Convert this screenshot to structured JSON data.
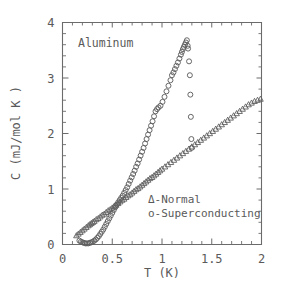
{
  "chart_data": {
    "type": "scatter",
    "title": "",
    "annotation": "Aluminum",
    "xlabel": "T (K)",
    "ylabel": "C (mJ/mol K )",
    "xlim": [
      0,
      2
    ],
    "ylim": [
      0,
      4
    ],
    "xticks": [
      0,
      0.5,
      1,
      1.5,
      2
    ],
    "xticklabels": [
      "0",
      "0.5",
      "1",
      "1.5",
      "2"
    ],
    "yticks": [
      0,
      1,
      2,
      3,
      4
    ],
    "yticklabels": [
      "0",
      "1",
      "2",
      "3",
      "4"
    ],
    "x_minor_step": 0.1,
    "y_minor_step": 0.2,
    "grid": false,
    "legend_position": "inside-lower-right",
    "legend": [
      {
        "marker": "triangle",
        "label": "Δ-Normal"
      },
      {
        "marker": "circle",
        "label": "o-Superconducting"
      }
    ],
    "series": [
      {
        "name": "Normal",
        "marker": "triangle",
        "points": [
          [
            0.14,
            0.16
          ],
          [
            0.16,
            0.19
          ],
          [
            0.18,
            0.22
          ],
          [
            0.2,
            0.25
          ],
          [
            0.22,
            0.28
          ],
          [
            0.24,
            0.31
          ],
          [
            0.26,
            0.34
          ],
          [
            0.275,
            0.36
          ],
          [
            0.29,
            0.38
          ],
          [
            0.305,
            0.4
          ],
          [
            0.32,
            0.42
          ],
          [
            0.34,
            0.45
          ],
          [
            0.36,
            0.47
          ],
          [
            0.38,
            0.5
          ],
          [
            0.4,
            0.53
          ],
          [
            0.42,
            0.55
          ],
          [
            0.44,
            0.58
          ],
          [
            0.46,
            0.61
          ],
          [
            0.48,
            0.63
          ],
          [
            0.5,
            0.66
          ],
          [
            0.52,
            0.69
          ],
          [
            0.54,
            0.71
          ],
          [
            0.56,
            0.74
          ],
          [
            0.58,
            0.77
          ],
          [
            0.6,
            0.8
          ],
          [
            0.62,
            0.82
          ],
          [
            0.64,
            0.85
          ],
          [
            0.66,
            0.88
          ],
          [
            0.68,
            0.9
          ],
          [
            0.7,
            0.93
          ],
          [
            0.72,
            0.96
          ],
          [
            0.74,
            0.99
          ],
          [
            0.76,
            1.01
          ],
          [
            0.78,
            1.04
          ],
          [
            0.8,
            1.07
          ],
          [
            0.82,
            1.1
          ],
          [
            0.84,
            1.13
          ],
          [
            0.86,
            1.16
          ],
          [
            0.88,
            1.19
          ],
          [
            0.9,
            1.21
          ],
          [
            0.92,
            1.24
          ],
          [
            0.94,
            1.27
          ],
          [
            0.96,
            1.3
          ],
          [
            0.98,
            1.33
          ],
          [
            1.0,
            1.36
          ],
          [
            1.03,
            1.4
          ],
          [
            1.06,
            1.44
          ],
          [
            1.09,
            1.48
          ],
          [
            1.12,
            1.52
          ],
          [
            1.15,
            1.56
          ],
          [
            1.18,
            1.6
          ],
          [
            1.21,
            1.64
          ],
          [
            1.24,
            1.68
          ],
          [
            1.27,
            1.72
          ],
          [
            1.3,
            1.76
          ],
          [
            1.33,
            1.8
          ],
          [
            1.36,
            1.84
          ],
          [
            1.39,
            1.88
          ],
          [
            1.42,
            1.92
          ],
          [
            1.45,
            1.96
          ],
          [
            1.48,
            2.0
          ],
          [
            1.51,
            2.04
          ],
          [
            1.54,
            2.08
          ],
          [
            1.57,
            2.12
          ],
          [
            1.6,
            2.16
          ],
          [
            1.63,
            2.2
          ],
          [
            1.66,
            2.24
          ],
          [
            1.69,
            2.28
          ],
          [
            1.72,
            2.32
          ],
          [
            1.75,
            2.36
          ],
          [
            1.78,
            2.4
          ],
          [
            1.81,
            2.44
          ],
          [
            1.84,
            2.48
          ],
          [
            1.87,
            2.52
          ],
          [
            1.9,
            2.55
          ],
          [
            1.93,
            2.58
          ],
          [
            1.96,
            2.6
          ],
          [
            1.99,
            2.62
          ]
        ]
      },
      {
        "name": "Superconducting",
        "marker": "circle",
        "points": [
          [
            0.17,
            0.07
          ],
          [
            0.185,
            0.05
          ],
          [
            0.2,
            0.04
          ],
          [
            0.215,
            0.03
          ],
          [
            0.23,
            0.02
          ],
          [
            0.245,
            0.02
          ],
          [
            0.26,
            0.02
          ],
          [
            0.275,
            0.03
          ],
          [
            0.29,
            0.04
          ],
          [
            0.305,
            0.05
          ],
          [
            0.32,
            0.07
          ],
          [
            0.335,
            0.09
          ],
          [
            0.35,
            0.12
          ],
          [
            0.365,
            0.15
          ],
          [
            0.38,
            0.19
          ],
          [
            0.395,
            0.23
          ],
          [
            0.41,
            0.27
          ],
          [
            0.425,
            0.32
          ],
          [
            0.44,
            0.37
          ],
          [
            0.455,
            0.42
          ],
          [
            0.47,
            0.47
          ],
          [
            0.485,
            0.52
          ],
          [
            0.5,
            0.57
          ],
          [
            0.515,
            0.62
          ],
          [
            0.53,
            0.67
          ],
          [
            0.545,
            0.72
          ],
          [
            0.56,
            0.76
          ],
          [
            0.575,
            0.8
          ],
          [
            0.59,
            0.84
          ],
          [
            0.605,
            0.88
          ],
          [
            0.62,
            0.93
          ],
          [
            0.635,
            0.98
          ],
          [
            0.65,
            1.03
          ],
          [
            0.665,
            1.09
          ],
          [
            0.68,
            1.15
          ],
          [
            0.695,
            1.21
          ],
          [
            0.71,
            1.27
          ],
          [
            0.725,
            1.33
          ],
          [
            0.74,
            1.4
          ],
          [
            0.755,
            1.46
          ],
          [
            0.77,
            1.53
          ],
          [
            0.785,
            1.6
          ],
          [
            0.8,
            1.67
          ],
          [
            0.815,
            1.74
          ],
          [
            0.83,
            1.82
          ],
          [
            0.845,
            1.9
          ],
          [
            0.86,
            1.98
          ],
          [
            0.875,
            2.06
          ],
          [
            0.89,
            2.14
          ],
          [
            0.905,
            2.22
          ],
          [
            0.92,
            2.31
          ],
          [
            0.935,
            2.4
          ],
          [
            0.95,
            2.44
          ],
          [
            0.965,
            2.47
          ],
          [
            0.985,
            2.5
          ],
          [
            1.005,
            2.57
          ],
          [
            1.025,
            2.66
          ],
          [
            1.045,
            2.76
          ],
          [
            1.065,
            2.86
          ],
          [
            1.085,
            2.96
          ],
          [
            1.1,
            3.05
          ],
          [
            1.115,
            3.1
          ],
          [
            1.13,
            3.16
          ],
          [
            1.145,
            3.22
          ],
          [
            1.16,
            3.28
          ],
          [
            1.175,
            3.35
          ],
          [
            1.19,
            3.42
          ],
          [
            1.2,
            3.47
          ],
          [
            1.21,
            3.52
          ],
          [
            1.22,
            3.56
          ],
          [
            1.23,
            3.6
          ],
          [
            1.24,
            3.64
          ],
          [
            1.25,
            3.68
          ],
          [
            1.258,
            3.58
          ],
          [
            1.262,
            3.53
          ],
          [
            1.272,
            3.3
          ],
          [
            1.28,
            3.05
          ],
          [
            1.285,
            2.7
          ],
          [
            1.29,
            2.3
          ],
          [
            1.295,
            1.9
          ],
          [
            1.298,
            1.74
          ]
        ]
      }
    ]
  },
  "axes": {
    "x_title": "T (K)",
    "y_title": "C (mJ/mol K )"
  }
}
